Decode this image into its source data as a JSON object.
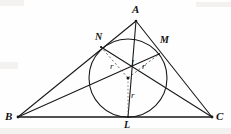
{
  "figure": {
    "kind": "geometry-diagram",
    "caption_text": "",
    "width": 231,
    "height": 134,
    "background_color": "#fefefe",
    "stroke_color": "#1a1a1a"
  },
  "labels": {
    "apex": "A",
    "left_vertex": "B",
    "right_vertex": "C",
    "tangent_left": "N",
    "tangent_right": "M",
    "tangent_bottom": "L",
    "incenter": "I",
    "radius_left": "r",
    "radius_right": "r",
    "radius_bottom": "r"
  },
  "geometry": {
    "points": {
      "A": {
        "x": 136,
        "y": 21
      },
      "B": {
        "x": 18,
        "y": 117
      },
      "C": {
        "x": 212,
        "y": 117
      },
      "I": {
        "x": 128,
        "y": 78
      },
      "L": {
        "x": 128,
        "y": 117
      },
      "M": {
        "x": 159,
        "y": 54
      },
      "N": {
        "x": 101,
        "y": 47
      }
    },
    "incircle": {
      "cx": 128,
      "cy": 78,
      "r": 39
    },
    "segments": [
      {
        "name": "side-AB",
        "from": "A",
        "to": "B",
        "style": "solid"
      },
      {
        "name": "side-AC",
        "from": "A",
        "to": "C",
        "style": "solid"
      },
      {
        "name": "side-BC",
        "from": "B",
        "to": "C",
        "style": "solid"
      },
      {
        "name": "cevian-AL",
        "from": "A",
        "to": "L",
        "style": "solid"
      },
      {
        "name": "cevian-BM",
        "from": "B",
        "to": "M",
        "style": "solid"
      },
      {
        "name": "cevian-CN",
        "from": "C",
        "to": "N",
        "style": "solid"
      },
      {
        "name": "radius-IN",
        "from": "I",
        "to": "N",
        "style": "dashed"
      },
      {
        "name": "radius-IM",
        "from": "I",
        "to": "M",
        "style": "dashed"
      },
      {
        "name": "radius-IL",
        "from": "I",
        "to": "L",
        "style": "dotted"
      }
    ]
  },
  "label_positions": {
    "A": {
      "x": 132,
      "y": 4
    },
    "B": {
      "x": 5,
      "y": 112
    },
    "C": {
      "x": 216,
      "y": 112
    },
    "N": {
      "x": 95,
      "y": 32
    },
    "M": {
      "x": 160,
      "y": 35
    },
    "L": {
      "x": 124,
      "y": 121
    },
    "I": {
      "x": 131,
      "y": 60
    },
    "r_left": {
      "x": 110,
      "y": 63
    },
    "r_right": {
      "x": 142,
      "y": 63
    },
    "r_bottom": {
      "x": 131,
      "y": 92
    }
  }
}
